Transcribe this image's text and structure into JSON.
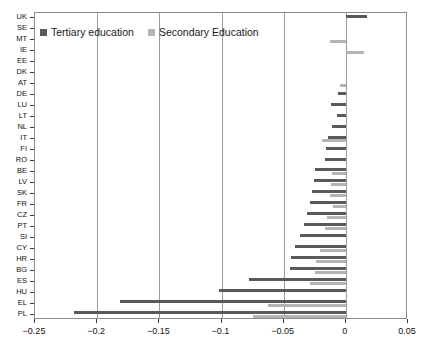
{
  "chart_data": {
    "type": "bar",
    "orientation": "horizontal",
    "title": "",
    "xlabel": "",
    "ylabel": "",
    "xlim": [
      -0.25,
      0.05
    ],
    "xticks": [
      -0.25,
      -0.2,
      -0.15,
      -0.1,
      -0.05,
      0,
      0.05
    ],
    "xtick_labels": [
      "−0.25",
      "−0.2",
      "−0.15",
      "−0.1",
      "−0.05",
      "0",
      "0.05"
    ],
    "grid": true,
    "grid_axis": "x",
    "legend_position": "top-left-inside",
    "categories": [
      "UK",
      "SE",
      "MT",
      "IE",
      "EE",
      "DK",
      "AT",
      "DE",
      "LU",
      "LT",
      "NL",
      "IT",
      "FI",
      "RO",
      "BE",
      "LV",
      "SK",
      "FR",
      "CZ",
      "PT",
      "SI",
      "CY",
      "HR",
      "BG",
      "ES",
      "HU",
      "EL",
      "PL"
    ],
    "series": [
      {
        "name": "Tertiary education",
        "color": "#5a5a5a",
        "values": [
          0.017,
          0.0,
          0.0,
          0.0,
          0.0,
          0.0,
          0.0,
          -0.006,
          -0.012,
          -0.007,
          -0.011,
          -0.014,
          -0.016,
          -0.017,
          -0.025,
          -0.026,
          -0.027,
          -0.029,
          -0.031,
          -0.034,
          -0.037,
          -0.041,
          -0.044,
          -0.045,
          -0.078,
          -0.102,
          -0.182,
          -0.219
        ]
      },
      {
        "name": "Secondary Education",
        "color": "#b4b4b4",
        "values": [
          0.0,
          0.0,
          -0.013,
          0.015,
          0.0,
          0.0,
          -0.005,
          0.0,
          0.0,
          0.0,
          0.0,
          -0.019,
          0.0,
          0.0,
          -0.011,
          -0.012,
          -0.013,
          -0.01,
          -0.015,
          -0.017,
          0.0,
          -0.021,
          -0.024,
          -0.025,
          -0.029,
          0.0,
          -0.063,
          -0.075
        ]
      }
    ]
  },
  "legend": {
    "items": [
      {
        "label": "Tertiary education",
        "color": "#5a5a5a"
      },
      {
        "label": "Secondary Education",
        "color": "#b4b4b4"
      }
    ]
  }
}
